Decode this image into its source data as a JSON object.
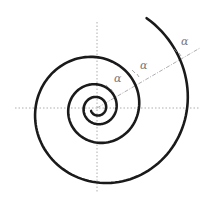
{
  "diagram": {
    "center": [
      97,
      108
    ],
    "spiral": {
      "color": "#1a1a1a",
      "stroke_width": 2.6,
      "growth_per_turn": 2.15,
      "turns": 3.3
    },
    "axes": {
      "color": "#999999",
      "horizontal": [
        15,
        200
      ],
      "vertical": [
        22,
        193
      ]
    },
    "ray": {
      "color": "#999999",
      "end": [
        200,
        48
      ]
    },
    "angle_labels": [
      {
        "text": "α",
        "x": 114,
        "y": 76
      },
      {
        "text": "α",
        "x": 140,
        "y": 63
      },
      {
        "text": "α",
        "x": 181,
        "y": 38
      }
    ]
  }
}
